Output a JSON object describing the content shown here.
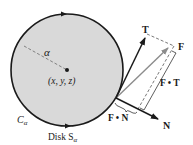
{
  "diagram": {
    "colors": {
      "disk_fill": "#d9d9d9",
      "stroke": "#1a1a1a",
      "f_vector": "#8c8c8c",
      "dashed": "#555555",
      "background": "#ffffff"
    },
    "disk": {
      "center": [
        67,
        70
      ],
      "radius": 56
    },
    "labels": {
      "radius": "α",
      "center_point": "(x, y, z)",
      "curve": "C",
      "curve_sub": "α",
      "disk": "Disk S",
      "disk_sub": "α",
      "tangent": "T",
      "force": "F",
      "normal": "N",
      "f_dot_t": "F • T",
      "f_dot_n": "F • N"
    }
  }
}
